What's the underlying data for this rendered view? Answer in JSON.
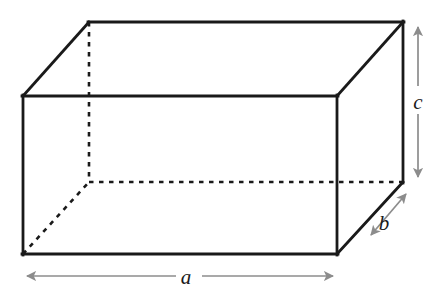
{
  "figure": {
    "kind": "geometry-diagram",
    "background_color": "#ffffff",
    "solid_edge_color": "#1a1a1a",
    "hidden_edge_color": "#1a1a1a",
    "dimension_arrow_color": "#8c8c8c",
    "labels": {
      "length": "a",
      "depth": "b",
      "height": "c"
    },
    "label_positions": {
      "length": {
        "x": 186,
        "y": 283
      },
      "depth": {
        "x": 384,
        "y": 229
      },
      "height": {
        "x": 414,
        "y": 108
      }
    },
    "front_face": {
      "left": 23,
      "top": 96,
      "right": 337,
      "bottom": 254
    },
    "depth_offset": {
      "dx": 66,
      "dy": -74
    },
    "back_face": {
      "left": 89,
      "top": 22,
      "right": 403,
      "bottom": 182
    },
    "solid_edges": [
      {
        "name": "front-top",
        "x1": 23,
        "y1": 96,
        "x2": 337,
        "y2": 96
      },
      {
        "name": "front-right",
        "x1": 337,
        "y1": 96,
        "x2": 337,
        "y2": 254
      },
      {
        "name": "front-bottom",
        "x1": 337,
        "y1": 254,
        "x2": 23,
        "y2": 254
      },
      {
        "name": "front-left",
        "x1": 23,
        "y1": 254,
        "x2": 23,
        "y2": 96
      },
      {
        "name": "back-top",
        "x1": 89,
        "y1": 22,
        "x2": 403,
        "y2": 22
      },
      {
        "name": "back-right",
        "x1": 403,
        "y1": 22,
        "x2": 403,
        "y2": 182
      },
      {
        "name": "top-left-diagonal",
        "x1": 23,
        "y1": 96,
        "x2": 89,
        "y2": 22
      },
      {
        "name": "top-right-diagonal",
        "x1": 337,
        "y1": 96,
        "x2": 403,
        "y2": 22
      },
      {
        "name": "bottom-right-diagonal",
        "x1": 337,
        "y1": 254,
        "x2": 403,
        "y2": 182
      }
    ],
    "hidden_edges": [
      {
        "name": "back-left-vertical",
        "x1": 89,
        "y1": 22,
        "x2": 89,
        "y2": 182
      },
      {
        "name": "back-bottom-horizontal",
        "x1": 89,
        "y1": 182,
        "x2": 403,
        "y2": 182
      },
      {
        "name": "bottom-left-diagonal",
        "x1": 23,
        "y1": 254,
        "x2": 89,
        "y2": 182
      }
    ],
    "dimension_arrows": [
      {
        "name": "length-arrow",
        "x1": 23,
        "y1": 276,
        "x2": 337,
        "y2": 276,
        "double_headed": true
      },
      {
        "name": "height-arrow",
        "x1": 418,
        "y1": 23,
        "x2": 418,
        "y2": 181,
        "double_headed": true
      },
      {
        "name": "depth-arrow",
        "x1": 409,
        "y1": 191,
        "x2": 368,
        "y2": 239,
        "double_headed": true
      }
    ]
  }
}
